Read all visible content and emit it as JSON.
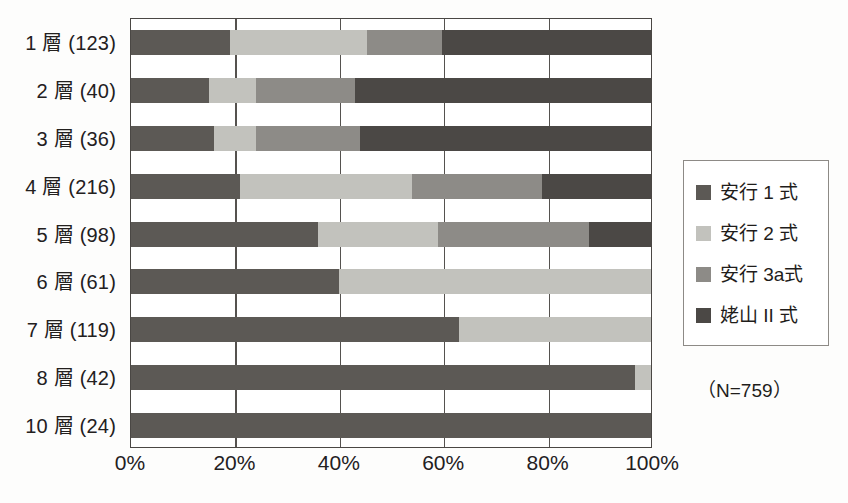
{
  "chart_data": {
    "type": "bar",
    "subtype": "stacked-horizontal-100pct",
    "title": "",
    "xlabel": "",
    "ylabel": "",
    "xlim": [
      0,
      100
    ],
    "xticks": [
      0,
      20,
      40,
      60,
      80,
      100
    ],
    "xticklabels": [
      "0%",
      "20%",
      "40%",
      "60%",
      "80%",
      "100%"
    ],
    "grid": true,
    "grid_axis": "x",
    "legend_position": "right",
    "annotation": "（N=759）",
    "total_n": 759,
    "categories": [
      "1 層 (123)",
      "2 層 (40)",
      "3 層 (36)",
      "4 層 (216)",
      "5 層 (98)",
      "6 層 (61)",
      "7 層 (119)",
      "8 層 (42)",
      "10 層 (24)"
    ],
    "category_counts": [
      123,
      40,
      36,
      216,
      98,
      61,
      119,
      42,
      24
    ],
    "series": [
      {
        "name": "安行 1 式",
        "color": "#5c5955",
        "values": [
          19.0,
          15.0,
          16.0,
          21.0,
          36.0,
          40.0,
          63.0,
          97.0,
          100.0
        ]
      },
      {
        "name": "安行 2 式",
        "color": "#c2c2bd",
        "values": [
          26.4,
          9.0,
          8.0,
          33.0,
          23.0,
          60.0,
          37.0,
          3.0,
          0.0
        ]
      },
      {
        "name": "安行 3a式",
        "color": "#8d8b87",
        "values": [
          14.4,
          19.0,
          20.0,
          25.0,
          29.0,
          0.0,
          0.0,
          0.0,
          0.0
        ]
      },
      {
        "name": "姥山 II 式",
        "color": "#4b4845",
        "values": [
          40.2,
          57.0,
          56.0,
          21.0,
          12.0,
          0.0,
          0.0,
          0.0,
          0.0
        ]
      }
    ]
  }
}
